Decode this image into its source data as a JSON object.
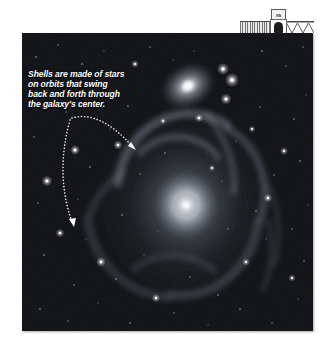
{
  "figure": {
    "name": "shell-galaxy-photograph",
    "background_color": "#ffffff",
    "photo": {
      "alt_name": "deep-sky-photograph",
      "background_color": "#05060a",
      "frame": {
        "x": 22,
        "y": 33,
        "width": 291,
        "height": 298
      }
    }
  },
  "header_band": {
    "badge_text": "NS",
    "hatch_name": "hatched-rule",
    "zigzag_name": "zigzag-rule"
  },
  "caption": {
    "full_text": "Shells are made of stars on orbits that swing back and forth through the galaxy's center.",
    "lines": [
      "Shells are made of stars",
      "on orbits that swing",
      "back and forth through",
      "the galaxy's center."
    ],
    "color": "#ffffff",
    "style": "italic-bold"
  },
  "annotations": {
    "leader_lines": [
      {
        "name": "leader-line-upper",
        "style": "dotted-curve-with-arrowhead",
        "from": {
          "x": 72,
          "y": 118
        },
        "to": {
          "x": 135,
          "y": 148
        },
        "control": {
          "x": 96,
          "y": 112
        },
        "color": "#ffffff"
      },
      {
        "name": "leader-line-lower",
        "style": "dotted-curve-with-arrowhead",
        "from": {
          "x": 70,
          "y": 120
        },
        "to": {
          "x": 73,
          "y": 224
        },
        "control": {
          "x": 58,
          "y": 172
        },
        "color": "#ffffff"
      }
    ]
  },
  "sky_objects": {
    "main_galaxy": {
      "name": "shell-elliptical-galaxy",
      "center": {
        "x": 186,
        "y": 205
      },
      "core_color": "#ffffff",
      "halo_color": "#9aa3b4"
    },
    "companion_galaxy": {
      "name": "companion-spiral-galaxy",
      "center": {
        "x": 188,
        "y": 86
      },
      "core_color": "#e9ecf2"
    },
    "shells": [
      {
        "name": "shell-arc-north",
        "color": "#8d96a8"
      },
      {
        "name": "shell-arc-east",
        "color": "#7e8798"
      },
      {
        "name": "shell-arc-south",
        "color": "#79828f"
      },
      {
        "name": "shell-arc-west",
        "color": "#6f7886"
      }
    ],
    "bright_stars": [
      {
        "x": 223,
        "y": 69,
        "r": 2.8
      },
      {
        "x": 232,
        "y": 80,
        "r": 3.2
      },
      {
        "x": 226,
        "y": 99,
        "r": 2.6
      },
      {
        "x": 199,
        "y": 118,
        "r": 2.0
      },
      {
        "x": 118,
        "y": 145,
        "r": 2.2
      },
      {
        "x": 75,
        "y": 150,
        "r": 2.4
      },
      {
        "x": 47,
        "y": 181,
        "r": 2.6
      },
      {
        "x": 60,
        "y": 233,
        "r": 2.1
      },
      {
        "x": 101,
        "y": 262,
        "r": 2.3
      },
      {
        "x": 268,
        "y": 198,
        "r": 2.0
      },
      {
        "x": 284,
        "y": 151,
        "r": 1.9
      },
      {
        "x": 156,
        "y": 298,
        "r": 2.0
      },
      {
        "x": 246,
        "y": 262,
        "r": 1.8
      },
      {
        "x": 292,
        "y": 278,
        "r": 1.7
      },
      {
        "x": 135,
        "y": 64,
        "r": 1.8
      },
      {
        "x": 252,
        "y": 129,
        "r": 1.6
      },
      {
        "x": 212,
        "y": 168,
        "r": 1.5
      },
      {
        "x": 163,
        "y": 121,
        "r": 1.5
      }
    ]
  }
}
